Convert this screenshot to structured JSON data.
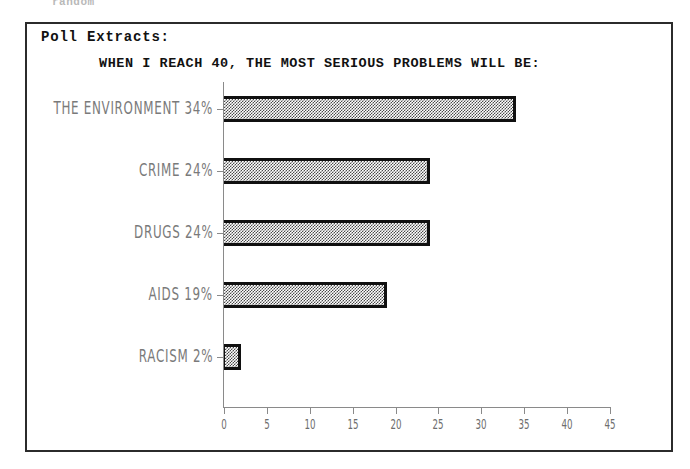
{
  "scan_artifact_text": "random",
  "panel": {
    "heading": "Poll Extracts:"
  },
  "chart_data": {
    "type": "bar",
    "orientation": "horizontal",
    "title": "WHEN I REACH 40, THE MOST SERIOUS PROBLEMS WILL BE:",
    "xlabel": "",
    "ylabel": "",
    "xlim": [
      0,
      45
    ],
    "xticks": [
      0,
      5,
      10,
      15,
      20,
      25,
      30,
      35,
      40,
      45
    ],
    "xtick_labels": [
      "0",
      "5",
      "10",
      "15",
      "20",
      "25",
      "30",
      "35",
      "40",
      "45"
    ],
    "grid": false,
    "legend": false,
    "categories": [
      "THE ENVIRONMENT 34%",
      "CRIME 24%",
      "DRUGS 24%",
      "AIDS 19%",
      "RACISM 2%"
    ],
    "values": [
      34,
      24,
      24,
      19,
      2
    ],
    "value_unit": "%",
    "bar_fill": "50% checkerboard dither",
    "bar_edge_color": "#101010",
    "axis_color": "#8a8a8a",
    "label_color": "#7a7a7a"
  }
}
